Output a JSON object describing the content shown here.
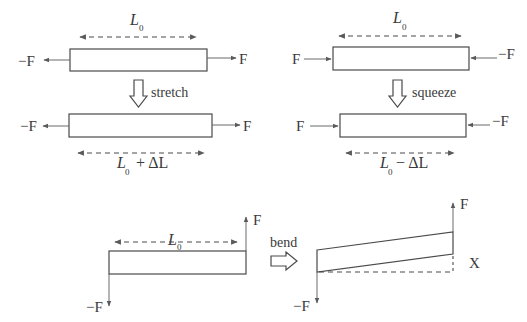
{
  "diagram": {
    "panels": {
      "stretch": {
        "original_length_label": "L",
        "original_length_sub": "0",
        "left_force": "−F",
        "right_force": "F",
        "action": "stretch",
        "deformed_left_force": "−F",
        "deformed_right_force": "F",
        "deformed_length_label": "L",
        "deformed_length_sub": "0",
        "deformed_length_op": "+ ΔL"
      },
      "squeeze": {
        "original_length_label": "L",
        "original_length_sub": "0",
        "left_force": "F",
        "right_force": "−F",
        "action": "squeeze",
        "deformed_left_force": "F",
        "deformed_right_force": "−F",
        "deformed_length_label": "L",
        "deformed_length_sub": "0",
        "deformed_length_op": "− ΔL"
      },
      "bend": {
        "original_length_label": "L",
        "original_length_sub": "0",
        "up_force": "F",
        "down_force": "−F",
        "action": "bend",
        "deformed_up_force": "F",
        "deformed_down_force": "−F",
        "deflection_label": "X"
      }
    },
    "colors": {
      "line": "#4a4a4a",
      "force_arrow": "#6a6a6a",
      "text": "#3a3a3a",
      "background": "#ffffff"
    }
  }
}
